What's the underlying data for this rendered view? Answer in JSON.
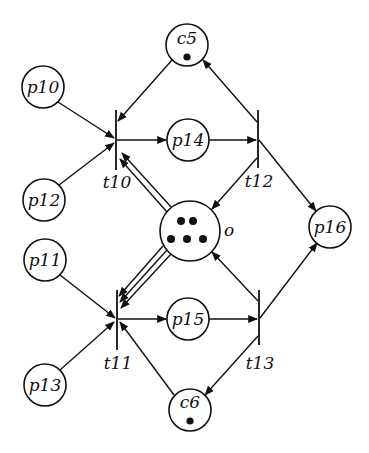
{
  "diagram": {
    "type": "petri-net",
    "places": [
      {
        "id": "c5",
        "label": "c5",
        "x": 187,
        "y": 45,
        "r": 21,
        "tokens": 1
      },
      {
        "id": "p10",
        "label": "p10",
        "x": 43,
        "y": 87,
        "r": 21,
        "tokens": 0
      },
      {
        "id": "p14",
        "label": "p14",
        "x": 188,
        "y": 140,
        "r": 21,
        "tokens": 0
      },
      {
        "id": "p12",
        "label": "p12",
        "x": 44,
        "y": 200,
        "r": 21,
        "tokens": 0
      },
      {
        "id": "o",
        "label": "o",
        "x": 190,
        "y": 231,
        "r": 30,
        "tokens": 5
      },
      {
        "id": "p16",
        "label": "p16",
        "x": 330,
        "y": 227,
        "r": 21,
        "tokens": 0
      },
      {
        "id": "p11",
        "label": "p11",
        "x": 45,
        "y": 260,
        "r": 21,
        "tokens": 0
      },
      {
        "id": "p15",
        "label": "p15",
        "x": 188,
        "y": 319,
        "r": 21,
        "tokens": 0
      },
      {
        "id": "p13",
        "label": "p13",
        "x": 45,
        "y": 385,
        "r": 21,
        "tokens": 0
      },
      {
        "id": "c6",
        "label": "c6",
        "x": 190,
        "y": 410,
        "r": 21,
        "tokens": 1
      }
    ],
    "transitions": [
      {
        "id": "t10",
        "label": "t10",
        "x": 116,
        "y1": 110,
        "y2": 170
      },
      {
        "id": "t12",
        "label": "t12",
        "x": 258,
        "y1": 110,
        "y2": 168
      },
      {
        "id": "t11",
        "label": "t11",
        "x": 117,
        "y1": 290,
        "y2": 350
      },
      {
        "id": "t13",
        "label": "t13",
        "x": 259,
        "y1": 290,
        "y2": 345
      }
    ],
    "arcs": [
      {
        "from": "p10",
        "to": "t10",
        "multiplicity": 1
      },
      {
        "from": "p12",
        "to": "t10",
        "multiplicity": 1
      },
      {
        "from": "c5",
        "to": "t10",
        "multiplicity": 1
      },
      {
        "from": "o",
        "to": "t10",
        "multiplicity": 2
      },
      {
        "from": "t10",
        "to": "p14",
        "multiplicity": 1
      },
      {
        "from": "p14",
        "to": "t12",
        "multiplicity": 1
      },
      {
        "from": "t12",
        "to": "c5",
        "multiplicity": 1
      },
      {
        "from": "t12",
        "to": "o",
        "multiplicity": 1
      },
      {
        "from": "t12",
        "to": "p16",
        "multiplicity": 1
      },
      {
        "from": "p11",
        "to": "t11",
        "multiplicity": 1
      },
      {
        "from": "p13",
        "to": "t11",
        "multiplicity": 1
      },
      {
        "from": "c6",
        "to": "t11",
        "multiplicity": 1
      },
      {
        "from": "o",
        "to": "t11",
        "multiplicity": 3
      },
      {
        "from": "t11",
        "to": "p15",
        "multiplicity": 1
      },
      {
        "from": "p15",
        "to": "t13",
        "multiplicity": 1
      },
      {
        "from": "t13",
        "to": "c6",
        "multiplicity": 1
      },
      {
        "from": "t13",
        "to": "o",
        "multiplicity": 1
      },
      {
        "from": "t13",
        "to": "p16",
        "multiplicity": 1
      }
    ]
  },
  "labels": {
    "c5": "c5",
    "p10": "p10",
    "p14": "p14",
    "p12": "p12",
    "o": "o",
    "p16": "p16",
    "p11": "p11",
    "p15": "p15",
    "p13": "p13",
    "c6": "c6",
    "t10": "t10",
    "t12": "t12",
    "t11": "t11",
    "t13": "t13"
  }
}
